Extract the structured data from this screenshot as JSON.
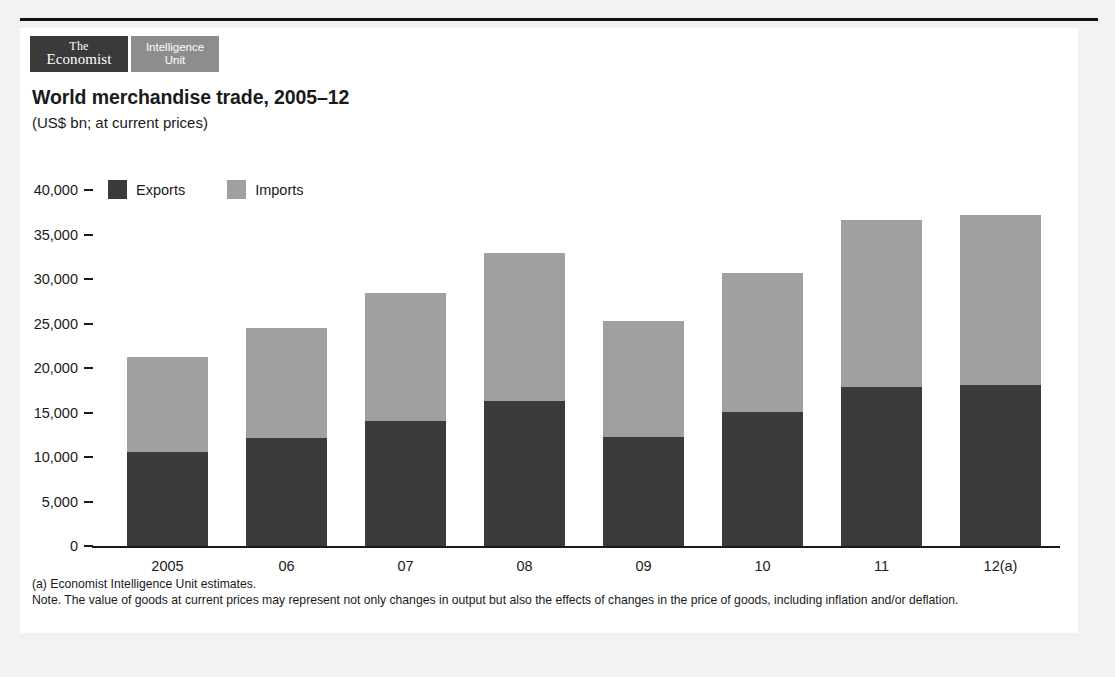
{
  "brand": {
    "economist_line1": "The",
    "economist_line2": "Economist",
    "eiu_line1": "Intelligence",
    "eiu_line2": "Unit",
    "dark_color": "#3a3a3a",
    "gray_color": "#8d8d8d"
  },
  "footnotes": {
    "source": "(a) Economist Intelligence Unit estimates.",
    "note": "Note. The value of goods at current prices may represent not only changes in output but also the effects of changes in the price of goods, including inflation and/or deflation."
  },
  "chart_data": {
    "type": "bar",
    "stacked": true,
    "title": "World merchandise trade, 2005–12",
    "subtitle": "(US$ bn; at current prices)",
    "xlabel": "",
    "ylabel": "",
    "ylim": [
      0,
      40000
    ],
    "yticks": [
      0,
      5000,
      10000,
      15000,
      20000,
      25000,
      30000,
      35000,
      40000
    ],
    "ytick_labels": [
      "0",
      "5,000",
      "10,000",
      "15,000",
      "20,000",
      "25,000",
      "30,000",
      "35,000",
      "40,000"
    ],
    "grid": false,
    "legend_position": "top-left",
    "categories": [
      "2005",
      "06",
      "07",
      "08",
      "09",
      "10",
      "11",
      "12(a)"
    ],
    "series": [
      {
        "name": "Exports",
        "color": "#3a3a3a",
        "values": [
          10550,
          12150,
          14050,
          16250,
          12300,
          15050,
          17900,
          18100
        ]
      },
      {
        "name": "Imports",
        "color": "#a0a0a0",
        "values": [
          10650,
          12400,
          14350,
          16650,
          12950,
          15650,
          18700,
          19100
        ]
      }
    ],
    "totals": [
      21200,
      24550,
      28400,
      32900,
      25250,
      30700,
      36600,
      37200
    ]
  }
}
